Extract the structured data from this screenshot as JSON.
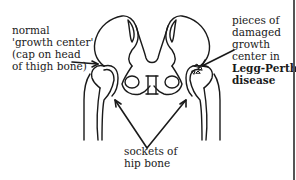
{
  "diagram": {
    "colors": {
      "line": "#1a1a1a",
      "background": "#ffffff",
      "border": "#555555"
    },
    "labels": {
      "normal_growth_center": {
        "lines": [
          "normal",
          "'growth center'",
          "(cap on head",
          "of thigh bone)"
        ]
      },
      "damaged_pieces": {
        "lines": [
          "pieces of",
          "damaged",
          "growth",
          "center in"
        ],
        "bold_lines": [
          "Legg-Perthes",
          "disease"
        ]
      },
      "sockets": {
        "lines": [
          "sockets of",
          "hip bone"
        ]
      }
    }
  }
}
